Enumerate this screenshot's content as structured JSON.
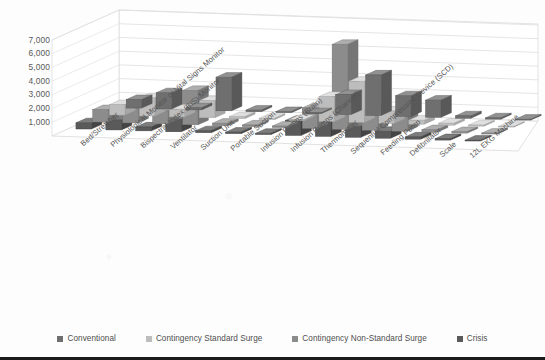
{
  "chart_data": {
    "type": "bar",
    "title": "",
    "subtitle": "",
    "xlabel": "",
    "ylabel": "",
    "ylim": [
      0,
      7000
    ],
    "yticks": [
      1000,
      2000,
      3000,
      4000,
      5000,
      6000,
      7000
    ],
    "ytick_labels": [
      "1,000",
      "2,000",
      "3,000",
      "4,000",
      "5,000",
      "6,000",
      "7,000"
    ],
    "grid": true,
    "legend_position": "bottom",
    "projection": "3d-clustered-column",
    "categories": [
      "Bed/Stretcher",
      "Physiological Monitor or Vital Signs Monitor",
      "Bispectral Index (BIS) Monitor",
      "Ventilator",
      "Suction Unit",
      "Portable Suction",
      "Infusion Pumps (Brain)",
      "Infusion Pumps (Channel)",
      "Thermometer",
      "Sequential Compression Device (SCD)",
      "Feeding Pump",
      "Defibrillator",
      "Scale",
      "12L EKG Machine"
    ],
    "series": [
      {
        "name": "Conventional",
        "color": "#6f6f6f",
        "values": [
          620,
          1180,
          150,
          2450,
          120,
          80,
          60,
          1450,
          2950,
          1500,
          1250,
          170,
          90,
          60
        ]
      },
      {
        "name": "Contingency Standard Surge",
        "color": "#bdbdbd",
        "values": [
          760,
          1320,
          560,
          1250,
          150,
          100,
          80,
          1820,
          3000,
          900,
          300,
          150,
          80,
          50
        ]
      },
      {
        "name": "Contingency Non-Standard Surge",
        "color": "#8c8c8c",
        "values": [
          900,
          1500,
          980,
          2500,
          180,
          120,
          110,
          1500,
          6200,
          1500,
          1250,
          180,
          110,
          70
        ]
      },
      {
        "name": "Crisis",
        "color": "#5a5a5a",
        "values": [
          450,
          720,
          280,
          900,
          140,
          110,
          90,
          1100,
          1400,
          800,
          500,
          160,
          100,
          60
        ]
      }
    ]
  },
  "legend": {
    "items": [
      {
        "label": "Conventional",
        "color": "#6f6f6f"
      },
      {
        "label": "Contingency Standard Surge",
        "color": "#bdbdbd"
      },
      {
        "label": "Contingency Non-Standard Surge",
        "color": "#8c8c8c"
      },
      {
        "label": "Crisis",
        "color": "#5a5a5a"
      }
    ]
  }
}
